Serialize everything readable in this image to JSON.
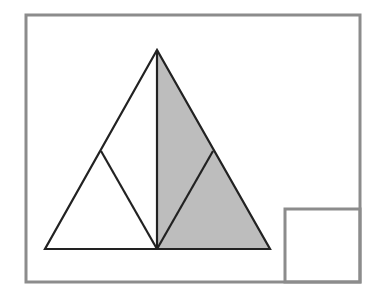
{
  "diagram": {
    "title": "Equilateral triangle divided into four regions with right half shaded",
    "colors": {
      "background": "#ffffff",
      "frame_stroke": "#8c8c8c",
      "line_stroke": "#222222",
      "shade_fill": "#bdbdbd",
      "white_fill": "#ffffff"
    },
    "frame": {
      "x": 26,
      "y": 15,
      "width": 334,
      "height": 267
    },
    "inset_square": {
      "x": 285,
      "y": 209,
      "width": 75,
      "height": 73
    },
    "triangle": {
      "apex": [
        157,
        50
      ],
      "base_left": [
        45,
        249
      ],
      "base_right": [
        270,
        249
      ],
      "base_mid": [
        157,
        249
      ],
      "left_mid": [
        101,
        151
      ],
      "right_mid": [
        213,
        151
      ]
    },
    "regions": [
      {
        "name": "left-lower-triangle",
        "shaded": false
      },
      {
        "name": "left-upper-region",
        "shaded": false
      },
      {
        "name": "right-upper-region",
        "shaded": true
      },
      {
        "name": "right-lower-triangle",
        "shaded": true
      }
    ]
  }
}
